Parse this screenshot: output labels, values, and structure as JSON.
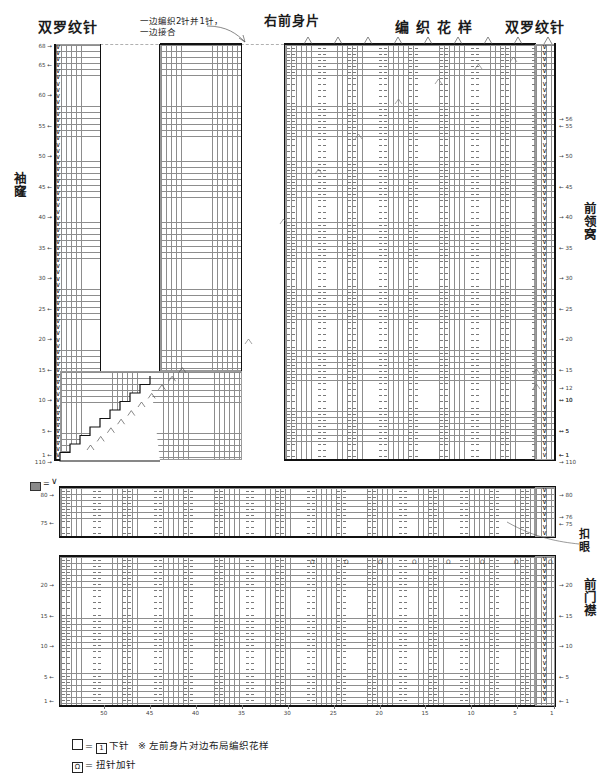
{
  "document": {
    "kind": "knitting-chart",
    "top_note": "一边编织2针并1针，\n一边接合"
  },
  "titles": {
    "rib_left": "双罗纹针",
    "join_note_line1": "一边编织2针并1针，",
    "join_note_line2": "一边接合",
    "right_front_piece": "右前身片",
    "pattern": "编 织 花 样",
    "rib_right": "双罗纹针"
  },
  "side_labels": {
    "armhole": "袖窿",
    "front_neckline": "前领窝",
    "buttonhole": "扣眼",
    "front_placket": "前门襟"
  },
  "legend": {
    "box_symbol": "□",
    "equals": "=",
    "one_symbol": "1",
    "knit_label": "下针",
    "asterisk": "※",
    "mirror_note": "左前身片对边布局编织花样",
    "twist_symbol": "Ω",
    "twist_label": "扭针加针",
    "swatch_equals": "=",
    "swatch_v": "∨"
  },
  "chart_data": {
    "type": "table",
    "xlabel": "",
    "ylabel": "",
    "panels": [
      {
        "name": "main-body",
        "left_row_ticks": [
          68,
          65,
          60,
          55,
          50,
          45,
          40,
          35,
          30,
          25,
          20,
          15,
          10,
          5,
          1
        ],
        "left_bottom_count": 110,
        "right_row_ticks": [
          56,
          55,
          50,
          45,
          40,
          35,
          30,
          25,
          20,
          15,
          10,
          5,
          1
        ],
        "right_extra_ticks": [
          12,
          10,
          5,
          1
        ],
        "right_bottom_count": 110,
        "stitch_columns": 110,
        "rows": 68
      },
      {
        "name": "buttonhole-band",
        "left_row_ticks": [
          80,
          75
        ],
        "right_row_ticks": [
          80,
          76,
          75
        ],
        "rows": 6
      },
      {
        "name": "front-placket",
        "left_row_ticks": [
          20,
          15,
          10,
          5,
          1
        ],
        "right_row_ticks": [
          20,
          15,
          10,
          5,
          1
        ],
        "rows": 22
      }
    ],
    "column_ticks": [
      50,
      45,
      40,
      35,
      30,
      25,
      20,
      15,
      10,
      5,
      1
    ],
    "decrease_symbol": "入",
    "increase_symbol": "Ω",
    "rib_symbol": "∨"
  },
  "colors": {
    "grid": "#8d8d8d",
    "heavy": "#111111",
    "text": "#1b1b1b",
    "dashed": "#b0b0b0",
    "swatch": "#8a8a8a"
  }
}
